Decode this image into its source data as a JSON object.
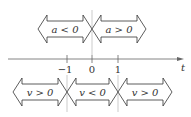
{
  "axis": {
    "variable": "t",
    "ticks": [
      {
        "label": "−1",
        "x": 67
      },
      {
        "label": "0",
        "x": 92
      },
      {
        "label": "1",
        "x": 118
      }
    ]
  },
  "acceleration_arrows": [
    {
      "label": "a < 0",
      "x1": 38,
      "x2": 92
    },
    {
      "label": "a > 0",
      "x1": 92,
      "x2": 146
    }
  ],
  "velocity_arrows": [
    {
      "label": "v > 0",
      "x1": 13,
      "x2": 67
    },
    {
      "label": "v < 0",
      "x1": 67,
      "x2": 118
    },
    {
      "label": "v > 0",
      "x1": 118,
      "x2": 172
    }
  ],
  "colors": {
    "stroke": "#333333",
    "axis": "#666666",
    "guide": "#aaaaaa"
  }
}
